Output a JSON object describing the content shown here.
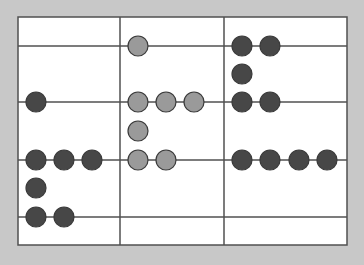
{
  "diagram": {
    "type": "bead-grid",
    "colors": {
      "background": "#c8c8c8",
      "panel": "#ffffff",
      "line": "#505050",
      "bead_dark": "#474747",
      "bead_light": "#9a9a9a",
      "bead_stroke": "#3a3a3a"
    },
    "frame": {
      "left": 18,
      "top": 17,
      "right": 347,
      "bottom": 245
    },
    "vertical_lines_x": [
      120,
      224
    ],
    "horizontal_lines_y": [
      46,
      102,
      160,
      217
    ],
    "bead_radius": 10,
    "columns": [
      {
        "name": "left",
        "beads": [
          {
            "x": 36,
            "y": 102,
            "tone": "dark"
          },
          {
            "x": 36,
            "y": 160,
            "tone": "dark"
          },
          {
            "x": 64,
            "y": 160,
            "tone": "dark"
          },
          {
            "x": 92,
            "y": 160,
            "tone": "dark"
          },
          {
            "x": 36,
            "y": 188,
            "tone": "dark"
          },
          {
            "x": 36,
            "y": 217,
            "tone": "dark"
          },
          {
            "x": 64,
            "y": 217,
            "tone": "dark"
          }
        ]
      },
      {
        "name": "middle",
        "beads": [
          {
            "x": 138,
            "y": 46,
            "tone": "light"
          },
          {
            "x": 138,
            "y": 102,
            "tone": "light"
          },
          {
            "x": 166,
            "y": 102,
            "tone": "light"
          },
          {
            "x": 194,
            "y": 102,
            "tone": "light"
          },
          {
            "x": 138,
            "y": 131,
            "tone": "light"
          },
          {
            "x": 138,
            "y": 160,
            "tone": "light"
          },
          {
            "x": 166,
            "y": 160,
            "tone": "light"
          }
        ]
      },
      {
        "name": "right",
        "beads": [
          {
            "x": 242,
            "y": 46,
            "tone": "dark"
          },
          {
            "x": 270,
            "y": 46,
            "tone": "dark"
          },
          {
            "x": 242,
            "y": 74,
            "tone": "dark"
          },
          {
            "x": 242,
            "y": 102,
            "tone": "dark"
          },
          {
            "x": 270,
            "y": 102,
            "tone": "dark"
          },
          {
            "x": 242,
            "y": 160,
            "tone": "dark"
          },
          {
            "x": 270,
            "y": 160,
            "tone": "dark"
          },
          {
            "x": 299,
            "y": 160,
            "tone": "dark"
          },
          {
            "x": 327,
            "y": 160,
            "tone": "dark"
          }
        ]
      }
    ]
  }
}
